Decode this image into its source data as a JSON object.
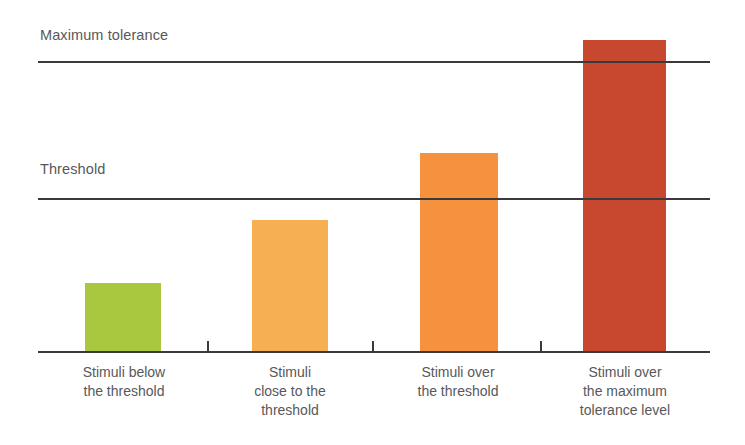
{
  "chart_data": {
    "type": "bar",
    "title": "",
    "subtitle": "",
    "xlabel": "",
    "ylabel": "",
    "grid": false,
    "legend": false,
    "legend_position": "none",
    "ylim": [
      0,
      100
    ],
    "categories": [
      "Stimuli below\nthe threshold",
      "Stimuli\nclose to the\nthreshold",
      "Stimuli over\nthe threshold",
      "Stimuli over\nthe maximum\ntolerance level"
    ],
    "values": [
      22,
      42,
      64,
      100
    ],
    "bar_colors": [
      "#a9c83f",
      "#f6b052",
      "#f6913d",
      "#c8482f"
    ],
    "reference_lines": [
      {
        "label": "Maximum tolerance",
        "value": 94,
        "color": "#3a3a3c"
      },
      {
        "label": "Threshold",
        "value": 49,
        "color": "#3a3a3c"
      }
    ],
    "axis_color": "#3a3a3c",
    "text_color": "#58585a",
    "background": "#ffffff"
  },
  "chart": {
    "reference_labels": {
      "maximum_tolerance": "Maximum tolerance",
      "threshold": "Threshold"
    },
    "bars": [
      {
        "label": "Stimuli below\nthe threshold",
        "color": "#a9c83f",
        "left": 85,
        "width": 76,
        "height": 69
      },
      {
        "label": "Stimuli\nclose to the\nthreshold",
        "color": "#f6b052",
        "left": 252,
        "width": 76,
        "height": 132
      },
      {
        "label": "Stimuli over\nthe threshold",
        "color": "#f6913d",
        "left": 420,
        "width": 78,
        "height": 199
      },
      {
        "label": "Stimuli over\nthe maximum\ntolerance level",
        "color": "#c8482f",
        "left": 583,
        "width": 83,
        "height": 312
      }
    ],
    "category_label_boxes": [
      {
        "left": 44,
        "width": 160
      },
      {
        "left": 210,
        "width": 160
      },
      {
        "left": 378,
        "width": 160
      },
      {
        "left": 544,
        "width": 162
      }
    ],
    "ticks": [
      207,
      372,
      540
    ]
  }
}
